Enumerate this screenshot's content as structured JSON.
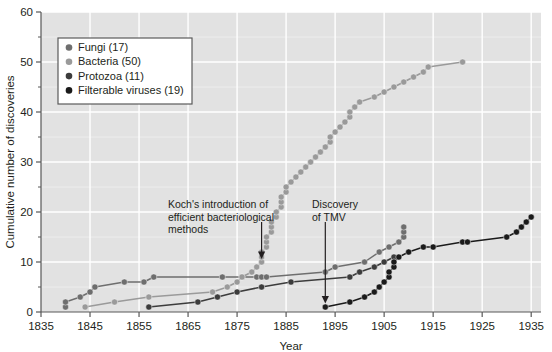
{
  "chart_data": {
    "type": "line",
    "title": "",
    "xlabel": "Year",
    "ylabel": "Cumulative number of discoveries",
    "xlim": [
      1835,
      1937
    ],
    "ylim": [
      0,
      60
    ],
    "xticks": [
      1835,
      1845,
      1855,
      1865,
      1875,
      1885,
      1895,
      1905,
      1915,
      1925,
      1935
    ],
    "xtick_labels": [
      "1835",
      "1845",
      "1855",
      "1865",
      "1875",
      "1885",
      "1895",
      "1905",
      "1915",
      "1925",
      "1935"
    ],
    "yticks": [
      0,
      10,
      20,
      30,
      40,
      50,
      60
    ],
    "ytick_labels": [
      "0",
      "10",
      "20",
      "30",
      "40",
      "50",
      "60"
    ],
    "yminorticks": [
      5,
      15,
      25,
      35,
      45,
      55
    ],
    "grid": true,
    "grid_color": "#ffffff",
    "plot_background": "#e2e2e2",
    "legend_position": "upper-left",
    "series": [
      {
        "name": "Fungi (17)",
        "color": "#6e6e6e",
        "points": [
          [
            1840,
            1
          ],
          [
            1840,
            2
          ],
          [
            1843,
            3
          ],
          [
            1845,
            4
          ],
          [
            1846,
            5
          ],
          [
            1852,
            6
          ],
          [
            1856,
            6
          ],
          [
            1858,
            7
          ],
          [
            1872,
            7
          ],
          [
            1876,
            7
          ],
          [
            1879,
            7
          ],
          [
            1880,
            7
          ],
          [
            1881,
            7
          ],
          [
            1893,
            8
          ],
          [
            1895,
            9
          ],
          [
            1901,
            10
          ],
          [
            1904,
            12
          ],
          [
            1906,
            13
          ],
          [
            1908,
            14
          ],
          [
            1909,
            15
          ],
          [
            1909,
            16
          ],
          [
            1909,
            17
          ]
        ]
      },
      {
        "name": "Bacteria (50)",
        "color": "#9a9a9a",
        "points": [
          [
            1844,
            1
          ],
          [
            1850,
            2
          ],
          [
            1857,
            3
          ],
          [
            1870,
            4
          ],
          [
            1873,
            5
          ],
          [
            1875,
            6
          ],
          [
            1876,
            7
          ],
          [
            1878,
            8
          ],
          [
            1879,
            9
          ],
          [
            1880,
            10
          ],
          [
            1880,
            11
          ],
          [
            1880,
            12
          ],
          [
            1881,
            13
          ],
          [
            1881,
            14
          ],
          [
            1881,
            15
          ],
          [
            1882,
            16
          ],
          [
            1882,
            17
          ],
          [
            1882,
            18
          ],
          [
            1883,
            19
          ],
          [
            1883,
            20
          ],
          [
            1884,
            21
          ],
          [
            1884,
            22
          ],
          [
            1884,
            23
          ],
          [
            1885,
            24
          ],
          [
            1885,
            25
          ],
          [
            1886,
            26
          ],
          [
            1887,
            27
          ],
          [
            1888,
            28
          ],
          [
            1889,
            29
          ],
          [
            1890,
            30
          ],
          [
            1891,
            31
          ],
          [
            1892,
            32
          ],
          [
            1893,
            33
          ],
          [
            1894,
            34
          ],
          [
            1894,
            35
          ],
          [
            1895,
            36
          ],
          [
            1896,
            37
          ],
          [
            1897,
            38
          ],
          [
            1898,
            39
          ],
          [
            1898,
            40
          ],
          [
            1899,
            41
          ],
          [
            1900,
            42
          ],
          [
            1903,
            43
          ],
          [
            1905,
            44
          ],
          [
            1907,
            45
          ],
          [
            1909,
            46
          ],
          [
            1911,
            47
          ],
          [
            1913,
            48
          ],
          [
            1914,
            49
          ],
          [
            1921,
            50
          ]
        ]
      },
      {
        "name": "Protozoa (11)",
        "color": "#3c3c3c",
        "points": [
          [
            1857,
            1
          ],
          [
            1867,
            2
          ],
          [
            1871,
            3
          ],
          [
            1875,
            4
          ],
          [
            1880,
            5
          ],
          [
            1886,
            6
          ],
          [
            1898,
            7
          ],
          [
            1900,
            8
          ],
          [
            1903,
            9
          ],
          [
            1905,
            10
          ],
          [
            1907,
            11
          ]
        ]
      },
      {
        "name": "Filterable viruses (19)",
        "color": "#1a1a1a",
        "points": [
          [
            1893,
            1
          ],
          [
            1898,
            2
          ],
          [
            1901,
            3
          ],
          [
            1903,
            4
          ],
          [
            1904,
            5
          ],
          [
            1905,
            6
          ],
          [
            1906,
            7
          ],
          [
            1906,
            8
          ],
          [
            1907,
            9
          ],
          [
            1907,
            10
          ],
          [
            1908,
            11
          ],
          [
            1910,
            12
          ],
          [
            1913,
            13
          ],
          [
            1915,
            13
          ],
          [
            1921,
            14
          ],
          [
            1922,
            14
          ],
          [
            1930,
            15
          ],
          [
            1932,
            16
          ],
          [
            1933,
            17
          ],
          [
            1934,
            18
          ],
          [
            1935,
            19
          ]
        ]
      }
    ],
    "annotations": [
      {
        "id": "koch",
        "lines": [
          "Koch's introduction of",
          "efficient bacteriological",
          "methods"
        ],
        "arrow_year": 1880,
        "arrow_value": 10.5
      },
      {
        "id": "tmv",
        "lines": [
          "Discovery",
          "of TMV"
        ],
        "arrow_year": 1893,
        "arrow_value": 1.6
      }
    ]
  },
  "legend": {
    "items": [
      {
        "label": "Fungi (17)",
        "color": "#6e6e6e"
      },
      {
        "label": "Bacteria (50)",
        "color": "#9a9a9a"
      },
      {
        "label": "Protozoa (11)",
        "color": "#3c3c3c"
      },
      {
        "label": "Filterable viruses (19)",
        "color": "#1a1a1a"
      }
    ]
  }
}
